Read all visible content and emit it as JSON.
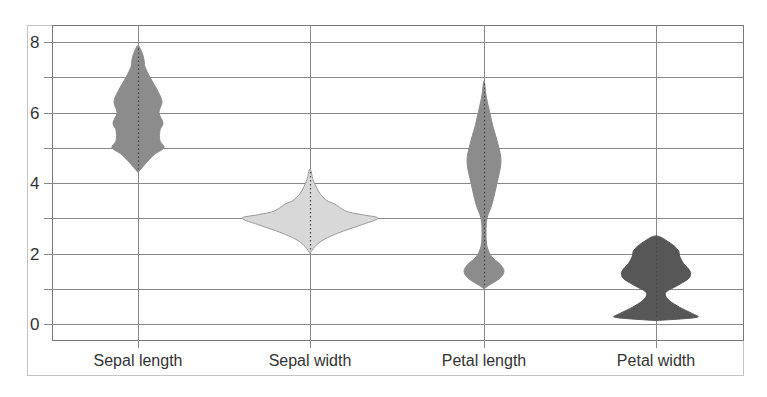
{
  "chart_data": {
    "type": "violin",
    "title": "",
    "xlabel": "",
    "ylabel": "",
    "categories": [
      "Sepal length",
      "Sepal width",
      "Petal length",
      "Petal width"
    ],
    "ylim": [
      -0.45,
      8.5
    ],
    "yticks": [
      0,
      2,
      4,
      6,
      8
    ],
    "minor_gridlines": [
      1,
      3,
      5,
      7
    ],
    "grid": true,
    "legend": null,
    "series": [
      {
        "name": "Sepal length",
        "fill": "#8c8c8c",
        "min": 4.3,
        "max": 7.9,
        "profile": [
          [
            4.3,
            0
          ],
          [
            4.5,
            6
          ],
          [
            4.8,
            16
          ],
          [
            5.0,
            26
          ],
          [
            5.2,
            22
          ],
          [
            5.5,
            22
          ],
          [
            5.7,
            25
          ],
          [
            6.0,
            21
          ],
          [
            6.3,
            24
          ],
          [
            6.6,
            20
          ],
          [
            7.0,
            12
          ],
          [
            7.3,
            7
          ],
          [
            7.5,
            6
          ],
          [
            7.7,
            4
          ],
          [
            7.9,
            0
          ]
        ]
      },
      {
        "name": "Sepal width",
        "fill": "#d8d8d8",
        "min": 2.0,
        "max": 4.4,
        "profile": [
          [
            2.0,
            0
          ],
          [
            2.2,
            5
          ],
          [
            2.4,
            14
          ],
          [
            2.6,
            30
          ],
          [
            2.8,
            50
          ],
          [
            3.0,
            68
          ],
          [
            3.1,
            52
          ],
          [
            3.2,
            36
          ],
          [
            3.4,
            25
          ],
          [
            3.5,
            17
          ],
          [
            3.7,
            10
          ],
          [
            3.9,
            6
          ],
          [
            4.1,
            3
          ],
          [
            4.4,
            0
          ]
        ]
      },
      {
        "name": "Petal length",
        "fill": "#8c8c8c",
        "min": 1.0,
        "max": 6.9,
        "profile": [
          [
            1.0,
            0
          ],
          [
            1.1,
            5
          ],
          [
            1.3,
            16
          ],
          [
            1.5,
            20
          ],
          [
            1.7,
            16
          ],
          [
            1.9,
            8
          ],
          [
            2.2,
            3
          ],
          [
            2.6,
            2
          ],
          [
            3.0,
            3
          ],
          [
            3.4,
            8
          ],
          [
            4.0,
            13
          ],
          [
            4.6,
            17
          ],
          [
            5.1,
            14
          ],
          [
            5.6,
            9
          ],
          [
            6.1,
            5
          ],
          [
            6.5,
            2
          ],
          [
            6.9,
            0
          ]
        ]
      },
      {
        "name": "Petal width",
        "fill": "#575757",
        "min": 0.1,
        "max": 2.5,
        "profile": [
          [
            0.1,
            0
          ],
          [
            0.15,
            28
          ],
          [
            0.2,
            42
          ],
          [
            0.3,
            36
          ],
          [
            0.5,
            22
          ],
          [
            0.7,
            12
          ],
          [
            0.9,
            10
          ],
          [
            1.1,
            22
          ],
          [
            1.3,
            33
          ],
          [
            1.5,
            34
          ],
          [
            1.7,
            28
          ],
          [
            1.9,
            24
          ],
          [
            2.1,
            22
          ],
          [
            2.3,
            14
          ],
          [
            2.5,
            0
          ]
        ]
      }
    ]
  },
  "colors": {
    "gridline": "#888888",
    "axis_frame": "#bbbbbb",
    "median_dots": "#444444"
  }
}
